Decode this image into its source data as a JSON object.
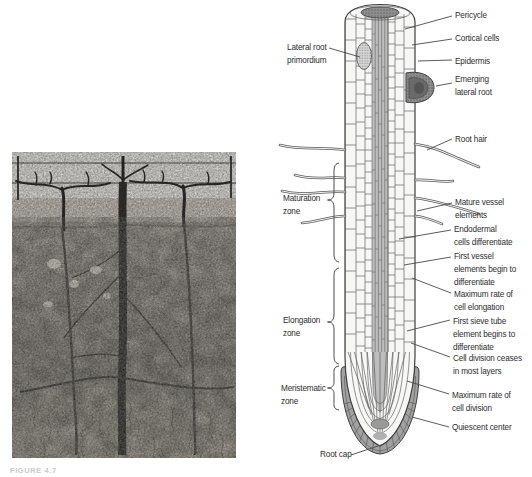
{
  "figure": {
    "caption": "FIGURE 4.7",
    "photo_description": "black-and-white photograph of a grapevine row with an excavated soil profile showing the root system"
  },
  "diagram": {
    "left_labels": [
      {
        "id": "lateral-root-primordium",
        "text": "Lateral root\nprimordium"
      },
      {
        "id": "maturation-zone",
        "text": "Maturation\nzone"
      },
      {
        "id": "elongation-zone",
        "text": "Elongation\nzone"
      },
      {
        "id": "meristematic-zone",
        "text": "Meristematic\nzone"
      },
      {
        "id": "root-cap",
        "text": "Root cap"
      }
    ],
    "right_labels": [
      {
        "id": "pericycle",
        "text": "Pericycle"
      },
      {
        "id": "cortical-cells",
        "text": "Cortical cells"
      },
      {
        "id": "epidermis",
        "text": "Epidermis"
      },
      {
        "id": "emerging-lateral-root",
        "text": "Emerging\nlateral root"
      },
      {
        "id": "root-hair",
        "text": "Root hair"
      },
      {
        "id": "mature-vessel-elements",
        "text": "Mature vessel\nelements"
      },
      {
        "id": "endodermal-cells",
        "text": "Endodermal\ncells differentiate"
      },
      {
        "id": "first-vessel-elements",
        "text": "First vessel\nelements begin to\ndifferentiate"
      },
      {
        "id": "max-cell-elongation",
        "text": "Maximum rate of\ncell elongation"
      },
      {
        "id": "first-sieve-tube",
        "text": "First sieve tube\nelement begins to\ndifferentiate"
      },
      {
        "id": "cell-division-ceases",
        "text": "Cell division ceases\nin most layers"
      },
      {
        "id": "max-cell-division",
        "text": "Maximum rate of\ncell division"
      },
      {
        "id": "quiescent-center",
        "text": "Quiescent center"
      }
    ],
    "colors": {
      "stele_gray": "#bdbdbd",
      "root_cap_gray": "#a2a2a2",
      "emerging_root_gray": "#8d8d8d",
      "outline": "#3e3e3e",
      "leader_line": "#4a4a4a",
      "label_text": "#2e2e2e"
    }
  }
}
